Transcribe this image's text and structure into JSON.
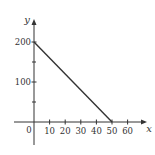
{
  "chart_data": {
    "type": "line",
    "title": "",
    "xlabel": "x",
    "ylabel": "y",
    "x_ticks": [
      10,
      20,
      30,
      40,
      50,
      60
    ],
    "x_tick_labels": [
      "10",
      "20",
      "30",
      "40",
      "50",
      "60"
    ],
    "y_ticks": [
      100,
      200
    ],
    "y_tick_labels": [
      "100",
      "200"
    ],
    "y_minor_ticks": [
      50,
      150
    ],
    "origin_label": "0",
    "xlim": [
      -4,
      72
    ],
    "ylim": [
      -55,
      255
    ],
    "grid": false,
    "legend": null,
    "series": [
      {
        "name": "line",
        "x": [
          0,
          50
        ],
        "y": [
          200,
          0
        ],
        "color": "#333333"
      }
    ]
  },
  "colors": {
    "axis": "#333333",
    "line": "#333333",
    "background": "#ffffff"
  }
}
